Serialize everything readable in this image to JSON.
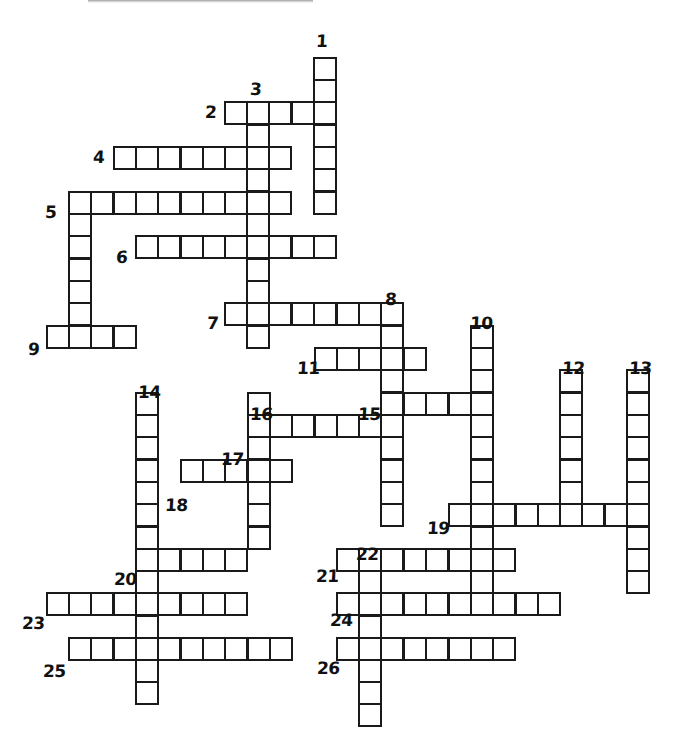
{
  "puzzle": {
    "title": "Crossword Grid",
    "cell_size": 22.3,
    "stroke_color": "#1a1a1a",
    "background_color": "#ffffff",
    "width": 673,
    "height": 753,
    "entries": [
      {
        "number": "1",
        "direction": "down",
        "col": 13,
        "row": 0,
        "length": 7,
        "label_x": 316,
        "label_y": 33
      },
      {
        "number": "2",
        "direction": "across",
        "col": 9,
        "row": 2,
        "length": 5,
        "label_x": 205,
        "label_y": 104
      },
      {
        "number": "3",
        "direction": "down",
        "col": 10,
        "row": 2,
        "length": 11,
        "label_x": 250,
        "label_y": 81
      },
      {
        "number": "4",
        "direction": "across",
        "col": 5,
        "row": 4,
        "length": 8,
        "label_x": 93,
        "label_y": 149
      },
      {
        "number": "5",
        "direction": "across",
        "col": 3,
        "row": 6,
        "length": 10,
        "label_x": 45,
        "label_y": 204
      },
      {
        "number": "5d",
        "direction": "down",
        "col": 3,
        "row": 6,
        "length": 7,
        "label_x": null,
        "label_y": null
      },
      {
        "number": "6",
        "direction": "across",
        "col": 6,
        "row": 8,
        "length": 9,
        "label_x": 116,
        "label_y": 249
      },
      {
        "number": "7",
        "direction": "across",
        "col": 10,
        "row": 12,
        "length": 8,
        "label_x": 207,
        "label_y": 315
      },
      {
        "number": "8",
        "direction": "down",
        "col": 17,
        "row": 12,
        "length": 10,
        "label_x": 385,
        "label_y": 291
      },
      {
        "number": "9",
        "direction": "across",
        "col": 2,
        "row": 13,
        "length": 4,
        "label_x": 28,
        "label_y": 341
      },
      {
        "number": "10",
        "direction": "down",
        "col": 21,
        "row": 13,
        "length": 12,
        "label_x": 470,
        "label_y": 315
      },
      {
        "number": "11",
        "direction": "across",
        "col": 14,
        "row": 14,
        "length": 5,
        "label_x": 297,
        "label_y": 360
      },
      {
        "number": "12",
        "direction": "down",
        "col": 25,
        "row": 15,
        "length": 7,
        "label_x": 562,
        "label_y": 360
      },
      {
        "number": "13",
        "direction": "down",
        "col": 28,
        "row": 15,
        "length": 12,
        "label_x": 629,
        "label_y": 360
      },
      {
        "number": "14",
        "direction": "down",
        "col": 6,
        "row": 16,
        "length": 14,
        "label_x": 138,
        "label_y": 384
      },
      {
        "number": "15",
        "direction": "across",
        "col": 16,
        "row": 16,
        "length": 6,
        "label_x": 358,
        "label_y": 406
      },
      {
        "number": "16",
        "direction": "down",
        "col": 11,
        "row": 17,
        "length": 7,
        "label_x": 250,
        "label_y": 406
      },
      {
        "number": "17",
        "direction": "across",
        "col": 11,
        "row": 18,
        "length": 7,
        "label_x": 221,
        "label_y": 451
      },
      {
        "number": "18",
        "direction": "across",
        "col": 8,
        "row": 20,
        "length": 5,
        "label_x": 165,
        "label_y": 497
      },
      {
        "number": "19",
        "direction": "across",
        "col": 20,
        "row": 22,
        "length": 9,
        "label_x": 427,
        "label_y": 520
      },
      {
        "number": "20",
        "direction": "across",
        "col": 6,
        "row": 23,
        "length": 6,
        "label_x": 114,
        "label_y": 571
      },
      {
        "number": "21",
        "direction": "across",
        "col": 15,
        "row": 23,
        "length": 8,
        "label_x": 316,
        "label_y": 568
      },
      {
        "number": "22",
        "direction": "down",
        "col": 16,
        "row": 23,
        "length": 8,
        "label_x": 356,
        "label_y": 546
      },
      {
        "number": "23",
        "direction": "across",
        "col": 2,
        "row": 25,
        "length": 9,
        "label_x": 22,
        "label_y": 615
      },
      {
        "number": "24",
        "direction": "across",
        "col": 15,
        "row": 25,
        "length": 10,
        "label_x": 330,
        "label_y": 612
      },
      {
        "number": "25",
        "direction": "across",
        "col": 3,
        "row": 27,
        "length": 10,
        "label_x": 43,
        "label_y": 663
      },
      {
        "number": "26",
        "direction": "across",
        "col": 15,
        "row": 27,
        "length": 8,
        "label_x": 317,
        "label_y": 660
      }
    ],
    "cells": [
      {
        "x": 313,
        "y": 57,
        "entry": "1"
      },
      {
        "x": 313,
        "y": 79,
        "entry": "1"
      },
      {
        "x": 313,
        "y": 101,
        "entry": "1-2"
      },
      {
        "x": 313,
        "y": 124,
        "entry": "1"
      },
      {
        "x": 313,
        "y": 146,
        "entry": "1"
      },
      {
        "x": 313,
        "y": 168,
        "entry": "1"
      },
      {
        "x": 313,
        "y": 191,
        "entry": "1"
      },
      {
        "x": 224,
        "y": 101,
        "entry": "2"
      },
      {
        "x": 246,
        "y": 101,
        "entry": "2-3"
      },
      {
        "x": 268,
        "y": 101,
        "entry": "2"
      },
      {
        "x": 291,
        "y": 101,
        "entry": "2"
      },
      {
        "x": 246,
        "y": 124,
        "entry": "3"
      },
      {
        "x": 246,
        "y": 146,
        "entry": "3-4"
      },
      {
        "x": 246,
        "y": 168,
        "entry": "3"
      },
      {
        "x": 246,
        "y": 191,
        "entry": "3-5"
      },
      {
        "x": 246,
        "y": 213,
        "entry": "3"
      },
      {
        "x": 246,
        "y": 235,
        "entry": "3-6"
      },
      {
        "x": 246,
        "y": 258,
        "entry": "3"
      },
      {
        "x": 246,
        "y": 280,
        "entry": "3"
      },
      {
        "x": 246,
        "y": 302,
        "entry": "3-7"
      },
      {
        "x": 246,
        "y": 325,
        "entry": "3"
      },
      {
        "x": 113,
        "y": 146,
        "entry": "4"
      },
      {
        "x": 135,
        "y": 146,
        "entry": "4"
      },
      {
        "x": 157,
        "y": 146,
        "entry": "4"
      },
      {
        "x": 180,
        "y": 146,
        "entry": "4"
      },
      {
        "x": 202,
        "y": 146,
        "entry": "4"
      },
      {
        "x": 224,
        "y": 146,
        "entry": "4"
      },
      {
        "x": 268,
        "y": 146,
        "entry": "4"
      },
      {
        "x": 68,
        "y": 191,
        "entry": "5"
      },
      {
        "x": 90,
        "y": 191,
        "entry": "5"
      },
      {
        "x": 113,
        "y": 191,
        "entry": "5"
      },
      {
        "x": 135,
        "y": 191,
        "entry": "5"
      },
      {
        "x": 157,
        "y": 191,
        "entry": "5"
      },
      {
        "x": 180,
        "y": 191,
        "entry": "5"
      },
      {
        "x": 202,
        "y": 191,
        "entry": "5"
      },
      {
        "x": 224,
        "y": 191,
        "entry": "5"
      },
      {
        "x": 268,
        "y": 191,
        "entry": "5"
      },
      {
        "x": 68,
        "y": 213,
        "entry": "5d"
      },
      {
        "x": 68,
        "y": 235,
        "entry": "5d"
      },
      {
        "x": 68,
        "y": 258,
        "entry": "5d"
      },
      {
        "x": 68,
        "y": 280,
        "entry": "5d"
      },
      {
        "x": 68,
        "y": 302,
        "entry": "5d"
      },
      {
        "x": 68,
        "y": 325,
        "entry": "5d-9"
      },
      {
        "x": 135,
        "y": 235,
        "entry": "6"
      },
      {
        "x": 157,
        "y": 235,
        "entry": "6"
      },
      {
        "x": 180,
        "y": 235,
        "entry": "6"
      },
      {
        "x": 202,
        "y": 235,
        "entry": "6"
      },
      {
        "x": 224,
        "y": 235,
        "entry": "6"
      },
      {
        "x": 268,
        "y": 235,
        "entry": "6"
      },
      {
        "x": 291,
        "y": 235,
        "entry": "6"
      },
      {
        "x": 313,
        "y": 235,
        "entry": "6"
      },
      {
        "x": 224,
        "y": 302,
        "entry": "7"
      },
      {
        "x": 268,
        "y": 302,
        "entry": "7"
      },
      {
        "x": 291,
        "y": 302,
        "entry": "7"
      },
      {
        "x": 313,
        "y": 302,
        "entry": "7"
      },
      {
        "x": 336,
        "y": 302,
        "entry": "7"
      },
      {
        "x": 358,
        "y": 302,
        "entry": "7"
      },
      {
        "x": 380,
        "y": 302,
        "entry": "7-8"
      },
      {
        "x": 380,
        "y": 325,
        "entry": "8"
      },
      {
        "x": 380,
        "y": 347,
        "entry": "8-11"
      },
      {
        "x": 380,
        "y": 369,
        "entry": "8"
      },
      {
        "x": 380,
        "y": 392,
        "entry": "8-15"
      },
      {
        "x": 380,
        "y": 414,
        "entry": "8"
      },
      {
        "x": 380,
        "y": 436,
        "entry": "8"
      },
      {
        "x": 380,
        "y": 459,
        "entry": "8-17"
      },
      {
        "x": 380,
        "y": 481,
        "entry": "8"
      },
      {
        "x": 380,
        "y": 503,
        "entry": "8"
      },
      {
        "x": 46,
        "y": 325,
        "entry": "9"
      },
      {
        "x": 90,
        "y": 325,
        "entry": "9"
      },
      {
        "x": 113,
        "y": 325,
        "entry": "9"
      },
      {
        "x": 470,
        "y": 325,
        "entry": "10"
      },
      {
        "x": 470,
        "y": 347,
        "entry": "10"
      },
      {
        "x": 470,
        "y": 369,
        "entry": "10"
      },
      {
        "x": 470,
        "y": 392,
        "entry": "10-15"
      },
      {
        "x": 470,
        "y": 414,
        "entry": "10"
      },
      {
        "x": 470,
        "y": 436,
        "entry": "10"
      },
      {
        "x": 470,
        "y": 459,
        "entry": "10"
      },
      {
        "x": 470,
        "y": 481,
        "entry": "10"
      },
      {
        "x": 470,
        "y": 503,
        "entry": "10-19"
      },
      {
        "x": 470,
        "y": 526,
        "entry": "10"
      },
      {
        "x": 470,
        "y": 548,
        "entry": "10-21"
      },
      {
        "x": 470,
        "y": 570,
        "entry": "10"
      },
      {
        "x": 314,
        "y": 347,
        "entry": "11"
      },
      {
        "x": 336,
        "y": 347,
        "entry": "11"
      },
      {
        "x": 358,
        "y": 347,
        "entry": "11"
      },
      {
        "x": 403,
        "y": 347,
        "entry": "11"
      },
      {
        "x": 559,
        "y": 369,
        "entry": "12"
      },
      {
        "x": 559,
        "y": 392,
        "entry": "12"
      },
      {
        "x": 559,
        "y": 414,
        "entry": "12"
      },
      {
        "x": 559,
        "y": 436,
        "entry": "12"
      },
      {
        "x": 559,
        "y": 459,
        "entry": "12"
      },
      {
        "x": 559,
        "y": 481,
        "entry": "12"
      },
      {
        "x": 559,
        "y": 503,
        "entry": "12-19"
      },
      {
        "x": 626,
        "y": 369,
        "entry": "13"
      },
      {
        "x": 626,
        "y": 392,
        "entry": "13"
      },
      {
        "x": 626,
        "y": 414,
        "entry": "13"
      },
      {
        "x": 626,
        "y": 436,
        "entry": "13"
      },
      {
        "x": 626,
        "y": 459,
        "entry": "13"
      },
      {
        "x": 626,
        "y": 481,
        "entry": "13"
      },
      {
        "x": 626,
        "y": 503,
        "entry": "13-19"
      },
      {
        "x": 626,
        "y": 526,
        "entry": "13"
      },
      {
        "x": 626,
        "y": 548,
        "entry": "13"
      },
      {
        "x": 626,
        "y": 570,
        "entry": "13"
      },
      {
        "x": 135,
        "y": 392,
        "entry": "14"
      },
      {
        "x": 135,
        "y": 414,
        "entry": "14"
      },
      {
        "x": 135,
        "y": 436,
        "entry": "14"
      },
      {
        "x": 135,
        "y": 459,
        "entry": "14"
      },
      {
        "x": 135,
        "y": 481,
        "entry": "14"
      },
      {
        "x": 135,
        "y": 503,
        "entry": "14"
      },
      {
        "x": 135,
        "y": 526,
        "entry": "14"
      },
      {
        "x": 135,
        "y": 548,
        "entry": "14-20"
      },
      {
        "x": 135,
        "y": 570,
        "entry": "14"
      },
      {
        "x": 135,
        "y": 592,
        "entry": "14-23"
      },
      {
        "x": 135,
        "y": 615,
        "entry": "14"
      },
      {
        "x": 135,
        "y": 637,
        "entry": "14-25"
      },
      {
        "x": 135,
        "y": 659,
        "entry": "14"
      },
      {
        "x": 135,
        "y": 681,
        "entry": "14"
      },
      {
        "x": 403,
        "y": 392,
        "entry": "15"
      },
      {
        "x": 425,
        "y": 392,
        "entry": "15"
      },
      {
        "x": 448,
        "y": 392,
        "entry": "15"
      },
      {
        "x": 247,
        "y": 392,
        "entry": "16"
      },
      {
        "x": 247,
        "y": 414,
        "entry": "16-17"
      },
      {
        "x": 247,
        "y": 436,
        "entry": "16"
      },
      {
        "x": 247,
        "y": 459,
        "entry": "16"
      },
      {
        "x": 247,
        "y": 481,
        "entry": "16"
      },
      {
        "x": 247,
        "y": 503,
        "entry": "16"
      },
      {
        "x": 247,
        "y": 526,
        "entry": "16"
      },
      {
        "x": 269,
        "y": 414,
        "entry": "17"
      },
      {
        "x": 291,
        "y": 414,
        "entry": "17"
      },
      {
        "x": 314,
        "y": 414,
        "entry": "17"
      },
      {
        "x": 336,
        "y": 414,
        "entry": "17"
      },
      {
        "x": 358,
        "y": 414,
        "entry": "17"
      },
      {
        "x": 180,
        "y": 459,
        "entry": "18"
      },
      {
        "x": 202,
        "y": 459,
        "entry": "18"
      },
      {
        "x": 224,
        "y": 459,
        "entry": "18"
      },
      {
        "x": 269,
        "y": 459,
        "entry": "18"
      },
      {
        "x": 448,
        "y": 503,
        "entry": "19"
      },
      {
        "x": 492,
        "y": 503,
        "entry": "19"
      },
      {
        "x": 515,
        "y": 503,
        "entry": "19"
      },
      {
        "x": 537,
        "y": 503,
        "entry": "19"
      },
      {
        "x": 581,
        "y": 503,
        "entry": "19"
      },
      {
        "x": 604,
        "y": 503,
        "entry": "19"
      },
      {
        "x": 157,
        "y": 548,
        "entry": "20"
      },
      {
        "x": 180,
        "y": 548,
        "entry": "20"
      },
      {
        "x": 202,
        "y": 548,
        "entry": "20"
      },
      {
        "x": 224,
        "y": 548,
        "entry": "20"
      },
      {
        "x": 336,
        "y": 548,
        "entry": "21"
      },
      {
        "x": 358,
        "y": 548,
        "entry": "21-22"
      },
      {
        "x": 380,
        "y": 548,
        "entry": "21"
      },
      {
        "x": 403,
        "y": 548,
        "entry": "21"
      },
      {
        "x": 425,
        "y": 548,
        "entry": "21"
      },
      {
        "x": 448,
        "y": 548,
        "entry": "21"
      },
      {
        "x": 492,
        "y": 548,
        "entry": "21"
      },
      {
        "x": 358,
        "y": 570,
        "entry": "22"
      },
      {
        "x": 358,
        "y": 592,
        "entry": "22-24"
      },
      {
        "x": 358,
        "y": 615,
        "entry": "22"
      },
      {
        "x": 358,
        "y": 637,
        "entry": "22-26"
      },
      {
        "x": 358,
        "y": 659,
        "entry": "22"
      },
      {
        "x": 358,
        "y": 681,
        "entry": "22"
      },
      {
        "x": 358,
        "y": 703,
        "entry": "22"
      },
      {
        "x": 46,
        "y": 592,
        "entry": "23"
      },
      {
        "x": 68,
        "y": 592,
        "entry": "23"
      },
      {
        "x": 90,
        "y": 592,
        "entry": "23"
      },
      {
        "x": 113,
        "y": 592,
        "entry": "23"
      },
      {
        "x": 157,
        "y": 592,
        "entry": "23"
      },
      {
        "x": 180,
        "y": 592,
        "entry": "23"
      },
      {
        "x": 202,
        "y": 592,
        "entry": "23"
      },
      {
        "x": 224,
        "y": 592,
        "entry": "23"
      },
      {
        "x": 336,
        "y": 592,
        "entry": "24"
      },
      {
        "x": 380,
        "y": 592,
        "entry": "24"
      },
      {
        "x": 403,
        "y": 592,
        "entry": "24"
      },
      {
        "x": 425,
        "y": 592,
        "entry": "24"
      },
      {
        "x": 448,
        "y": 592,
        "entry": "24"
      },
      {
        "x": 470,
        "y": 592,
        "entry": "24"
      },
      {
        "x": 492,
        "y": 592,
        "entry": "24"
      },
      {
        "x": 515,
        "y": 592,
        "entry": "24"
      },
      {
        "x": 537,
        "y": 592,
        "entry": "24"
      },
      {
        "x": 68,
        "y": 637,
        "entry": "25"
      },
      {
        "x": 90,
        "y": 637,
        "entry": "25"
      },
      {
        "x": 113,
        "y": 637,
        "entry": "25"
      },
      {
        "x": 157,
        "y": 637,
        "entry": "25"
      },
      {
        "x": 180,
        "y": 637,
        "entry": "25"
      },
      {
        "x": 202,
        "y": 637,
        "entry": "25"
      },
      {
        "x": 224,
        "y": 637,
        "entry": "25"
      },
      {
        "x": 247,
        "y": 637,
        "entry": "25"
      },
      {
        "x": 269,
        "y": 637,
        "entry": "25"
      },
      {
        "x": 336,
        "y": 637,
        "entry": "26"
      },
      {
        "x": 380,
        "y": 637,
        "entry": "26"
      },
      {
        "x": 403,
        "y": 637,
        "entry": "26"
      },
      {
        "x": 425,
        "y": 637,
        "entry": "26"
      },
      {
        "x": 448,
        "y": 637,
        "entry": "26"
      },
      {
        "x": 470,
        "y": 637,
        "entry": "26"
      },
      {
        "x": 492,
        "y": 637,
        "entry": "26"
      }
    ]
  }
}
